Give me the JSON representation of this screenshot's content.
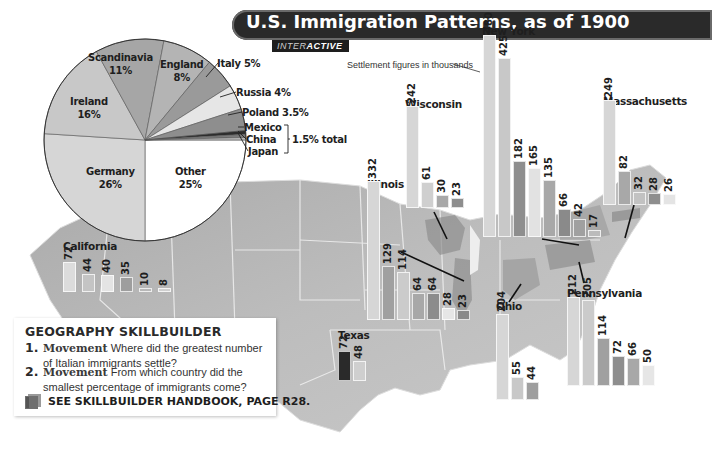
{
  "header": {
    "title": "U.S. Immigration Patterns, as of 1900",
    "tag_prefix": "INTER",
    "tag_bold": "ACTIVE"
  },
  "note": "Settlement figures in thousands",
  "pie": {
    "title": "Immigrant origins",
    "slices": [
      {
        "name": "Germany",
        "pct_label": "26%",
        "value": 26,
        "color": "#d6d6d6"
      },
      {
        "name": "Ireland",
        "pct_label": "16%",
        "value": 16,
        "color": "#c8c8c8"
      },
      {
        "name": "Scandinavia",
        "pct_label": "11%",
        "value": 11,
        "color": "#a6a6a6"
      },
      {
        "name": "England",
        "pct_label": "8%",
        "value": 8,
        "color": "#b4b4b4"
      },
      {
        "name": "Italy",
        "pct_label": "Italy 5%",
        "value": 5,
        "color": "#9a9a9a"
      },
      {
        "name": "Russia",
        "pct_label": "Russia 4%",
        "value": 4,
        "color": "#e6e6e6"
      },
      {
        "name": "Poland",
        "pct_label": "Poland 3.5%",
        "value": 3.5,
        "color": "#8e8e8e"
      },
      {
        "name": "Mexico",
        "pct_label": "Mexico",
        "value": 0.6,
        "color": "#2c2c2c"
      },
      {
        "name": "China",
        "pct_label": "China",
        "value": 0.5,
        "color": "#7a7a7a"
      },
      {
        "name": "Japan",
        "pct_label": "Japan",
        "value": 0.4,
        "color": "#bcbcbc"
      },
      {
        "name": "Other",
        "pct_label": "25%",
        "value": 25,
        "color": "#ffffff"
      }
    ],
    "bracket_label": "1.5% total"
  },
  "states": [
    {
      "name": "California",
      "values": [
        72,
        44,
        40,
        35,
        10,
        8
      ]
    },
    {
      "name": "Texas",
      "values": [
        72,
        48
      ]
    },
    {
      "name": "Illinois",
      "values": [
        332,
        129,
        114,
        64,
        64,
        28,
        23
      ]
    },
    {
      "name": "Wisconsin",
      "values": [
        242,
        61,
        30,
        23
      ]
    },
    {
      "name": "New York",
      "values": [
        480,
        425,
        182,
        165,
        135,
        66,
        42,
        17
      ]
    },
    {
      "name": "Massachusetts",
      "values": [
        249,
        82,
        32,
        28,
        26
      ]
    },
    {
      "name": "Ohio",
      "values": [
        204,
        55,
        44
      ]
    },
    {
      "name": "Pennsylvania",
      "values": [
        212,
        205,
        114,
        72,
        66,
        50
      ]
    }
  ],
  "skillbuilder": {
    "title": "GEOGRAPHY  SKILLBUILDER",
    "questions": [
      {
        "num": "1.",
        "keyword": "Movement",
        "text1": "Where did the greatest number",
        "text2": "of Italian immigrants settle?"
      },
      {
        "num": "2.",
        "keyword": "Movement",
        "text1": "From which country did the",
        "text2": "smallest percentage of immigrants come?"
      }
    ],
    "handbook": "SEE SKILLBUILDER HANDBOOK, PAGE R28."
  },
  "chart_data": [
    {
      "type": "pie",
      "title": "U.S. Immigration Patterns, as of 1900",
      "categories": [
        "Germany",
        "Ireland",
        "Scandinavia",
        "England",
        "Italy",
        "Russia",
        "Poland",
        "Mexico/China/Japan",
        "Other"
      ],
      "values": [
        26,
        16,
        11,
        8,
        5,
        4,
        3.5,
        1.5,
        25
      ],
      "annotations": [
        "Mexico, China, Japan: 1.5% total"
      ]
    },
    {
      "type": "bar",
      "title": "Settlement figures in thousands",
      "ylabel": "Immigrants (thousands)",
      "series": [
        {
          "name": "California",
          "values": [
            72,
            44,
            40,
            35,
            10,
            8
          ]
        },
        {
          "name": "Texas",
          "values": [
            72,
            48
          ]
        },
        {
          "name": "Illinois",
          "values": [
            332,
            129,
            114,
            64,
            64,
            28,
            23
          ]
        },
        {
          "name": "Wisconsin",
          "values": [
            242,
            61,
            30,
            23
          ]
        },
        {
          "name": "New York",
          "values": [
            480,
            425,
            182,
            165,
            135,
            66,
            42,
            17
          ]
        },
        {
          "name": "Massachusetts",
          "values": [
            249,
            82,
            32,
            28,
            26
          ]
        },
        {
          "name": "Ohio",
          "values": [
            204,
            55,
            44
          ]
        },
        {
          "name": "Pennsylvania",
          "values": [
            212,
            205,
            114,
            72,
            66,
            50
          ]
        }
      ]
    }
  ]
}
